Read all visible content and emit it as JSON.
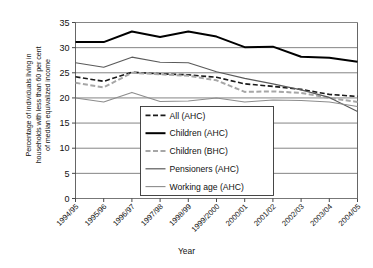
{
  "chart_data": {
    "type": "line",
    "title": "",
    "xlabel": "Year",
    "ylabel": "Percentage of individuals living in households with less than 60 per cent of median equivalized income",
    "ylabel_lines": [
      "Percentage of individuals living in",
      "households with less than 60 per cent",
      "of median equivalized income"
    ],
    "categories": [
      "1994/95",
      "1995/96",
      "1996/97",
      "1997/98",
      "1998/99",
      "1999/2000",
      "2000/01",
      "2001/02",
      "2002/03",
      "2003/04",
      "2004/05"
    ],
    "ylim": [
      0,
      35
    ],
    "yticks": [
      0,
      5,
      10,
      15,
      20,
      25,
      30,
      35
    ],
    "grid": true,
    "grid_axis": "y",
    "legend_position": "center",
    "series": [
      {
        "name": "All (AHC)",
        "style": "dashed",
        "color": "#1a1a1a",
        "width": 1.6,
        "dash": "5,2.5",
        "values": [
          24.2,
          23.3,
          25.1,
          24.8,
          24.6,
          24.1,
          22.8,
          22.3,
          21.7,
          20.7,
          20.3
        ]
      },
      {
        "name": "Children (AHC)",
        "style": "solid",
        "color": "#000000",
        "width": 2.0,
        "dash": "",
        "values": [
          31.1,
          31.1,
          33.2,
          32.1,
          33.2,
          32.2,
          30.1,
          30.2,
          28.2,
          28.0,
          27.2
        ]
      },
      {
        "name": "Children (BHC)",
        "style": "dashed",
        "color": "#a6a6a6",
        "width": 2.0,
        "dash": "5,2.5",
        "values": [
          23.0,
          22.1,
          25.0,
          24.7,
          24.4,
          23.5,
          21.2,
          21.3,
          21.0,
          20.0,
          19.2
        ]
      },
      {
        "name": "Pensioners (AHC)",
        "style": "solid",
        "color": "#5a5a5a",
        "width": 1.2,
        "dash": "",
        "values": [
          27.0,
          26.1,
          28.1,
          27.1,
          27.0,
          25.2,
          23.9,
          22.8,
          21.6,
          20.1,
          17.3
        ]
      },
      {
        "name": "Working age (AHC)",
        "style": "solid",
        "color": "#8c8c8c",
        "width": 1.1,
        "dash": "",
        "values": [
          20.0,
          19.2,
          21.1,
          19.3,
          19.4,
          20.0,
          19.2,
          19.6,
          19.5,
          19.2,
          18.3
        ]
      }
    ]
  }
}
